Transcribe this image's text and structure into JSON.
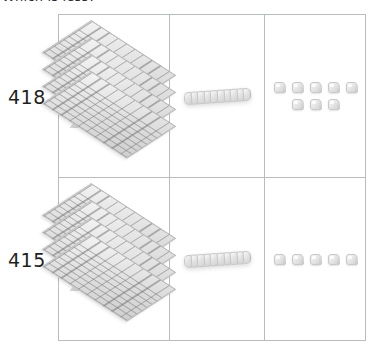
{
  "caption": "Which is less?",
  "rows": [
    {
      "label": "418",
      "hundreds": {
        "count": 4,
        "icon": "base-ten-flat-icon"
      },
      "tens": {
        "count": 1,
        "units_per_rod": 10,
        "icon": "base-ten-rod-icon"
      },
      "ones": {
        "count": 8,
        "groups": [
          5,
          3
        ],
        "icon": "base-ten-unit-cube-icon"
      }
    },
    {
      "label": "415",
      "hundreds": {
        "count": 4,
        "icon": "base-ten-flat-icon"
      },
      "tens": {
        "count": 1,
        "units_per_rod": 10,
        "icon": "base-ten-rod-icon"
      },
      "ones": {
        "count": 5,
        "groups": [
          5
        ],
        "icon": "base-ten-unit-cube-icon"
      }
    }
  ],
  "colors": {
    "grid_border": "#b9bcbe",
    "block_light": "#f2f2f2",
    "block_mid": "#dedede",
    "block_dark": "#cfcfcf",
    "text": "#1f1f1f"
  }
}
